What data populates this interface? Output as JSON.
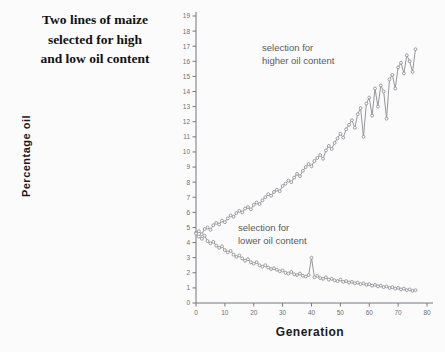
{
  "title": {
    "line1": "Two lines of maize",
    "line2": "selected for high",
    "line3": "and low oil content"
  },
  "chart_data": {
    "type": "line",
    "title": "Two lines of maize selected for high and low oil content",
    "xlabel": "Generation",
    "ylabel": "Percentage oil",
    "xlim": [
      0,
      80
    ],
    "ylim": [
      0,
      19
    ],
    "xticks": [
      0,
      10,
      20,
      30,
      40,
      50,
      60,
      70,
      80
    ],
    "yticks": [
      0,
      1,
      2,
      3,
      4,
      5,
      6,
      7,
      8,
      9,
      10,
      11,
      12,
      13,
      14,
      15,
      16,
      17,
      18,
      19
    ],
    "grid": false,
    "legend_position": "inline-annotation",
    "annotations": [
      {
        "name": "selection-for-higher-oil-content",
        "text": "selection for\nhigher oil content"
      },
      {
        "name": "selection-for-lower-oil-content",
        "text": "selection for\nlower oil content"
      }
    ],
    "marker": "circle-open",
    "color": "#8a8a90",
    "series": [
      {
        "name": "selection for higher oil content",
        "x": [
          0,
          1,
          2,
          3,
          4,
          5,
          6,
          7,
          8,
          9,
          10,
          11,
          12,
          13,
          14,
          15,
          16,
          17,
          18,
          19,
          20,
          21,
          22,
          23,
          24,
          25,
          26,
          27,
          28,
          29,
          30,
          31,
          32,
          33,
          34,
          35,
          36,
          37,
          38,
          39,
          40,
          41,
          42,
          43,
          44,
          45,
          46,
          47,
          48,
          49,
          50,
          51,
          52,
          53,
          54,
          55,
          56,
          57,
          58,
          59,
          60,
          61,
          62,
          63,
          64,
          65,
          66,
          67,
          68,
          69,
          70,
          71,
          72,
          73,
          74,
          75,
          76
        ],
        "values": [
          4.65,
          4.75,
          4.55,
          4.9,
          5.0,
          4.85,
          5.15,
          5.3,
          5.2,
          5.45,
          5.35,
          5.6,
          5.8,
          5.7,
          5.95,
          6.1,
          6.0,
          6.25,
          6.35,
          6.2,
          6.5,
          6.65,
          6.55,
          6.8,
          7.0,
          7.2,
          7.1,
          7.35,
          7.5,
          7.4,
          7.75,
          7.9,
          8.1,
          8.0,
          8.3,
          8.55,
          8.4,
          8.75,
          9.0,
          9.2,
          9.05,
          9.4,
          9.6,
          9.8,
          9.55,
          10.1,
          10.4,
          10.2,
          10.6,
          10.9,
          11.2,
          10.95,
          11.5,
          11.8,
          12.1,
          11.6,
          12.5,
          12.9,
          11.0,
          13.2,
          13.6,
          12.4,
          14.2,
          13.0,
          14.4,
          14.0,
          12.2,
          14.8,
          15.1,
          14.2,
          15.6,
          15.9,
          15.2,
          16.4,
          16.0,
          15.3,
          16.8
        ]
      },
      {
        "name": "selection for lower oil content",
        "x": [
          0,
          1,
          2,
          3,
          4,
          5,
          6,
          7,
          8,
          9,
          10,
          11,
          12,
          13,
          14,
          15,
          16,
          17,
          18,
          19,
          20,
          21,
          22,
          23,
          24,
          25,
          26,
          27,
          28,
          29,
          30,
          31,
          32,
          33,
          34,
          35,
          36,
          37,
          38,
          39,
          40,
          41,
          42,
          43,
          44,
          45,
          46,
          47,
          48,
          49,
          50,
          51,
          52,
          53,
          54,
          55,
          56,
          57,
          58,
          59,
          60,
          61,
          62,
          63,
          64,
          65,
          66,
          67,
          68,
          69,
          70,
          71,
          72,
          73,
          74,
          75,
          76
        ],
        "values": [
          4.6,
          4.4,
          4.25,
          4.45,
          4.1,
          3.95,
          4.05,
          3.8,
          3.65,
          3.75,
          3.5,
          3.35,
          3.45,
          3.2,
          3.05,
          3.15,
          2.95,
          2.8,
          2.9,
          2.7,
          2.6,
          2.7,
          2.5,
          2.4,
          2.5,
          2.35,
          2.25,
          2.3,
          2.2,
          2.1,
          2.15,
          2.0,
          1.95,
          2.05,
          1.9,
          1.85,
          1.95,
          1.8,
          1.75,
          1.85,
          3.0,
          1.7,
          1.8,
          1.65,
          1.6,
          1.7,
          1.55,
          1.6,
          1.5,
          1.45,
          1.55,
          1.4,
          1.45,
          1.35,
          1.4,
          1.3,
          1.35,
          1.25,
          1.3,
          1.2,
          1.25,
          1.15,
          1.2,
          1.1,
          1.15,
          1.05,
          1.1,
          1.0,
          1.05,
          0.95,
          1.0,
          0.9,
          0.95,
          0.85,
          0.9,
          0.8,
          0.85
        ]
      }
    ]
  },
  "axes": {
    "xlabel": "Generation",
    "ylabel": "Percentage oil"
  }
}
